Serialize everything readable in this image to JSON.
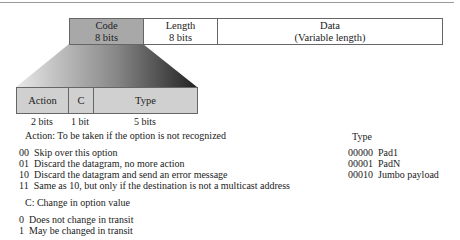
{
  "top_fields": [
    {
      "name": "Code",
      "size": "8 bits"
    },
    {
      "name": "Length",
      "size": "8 bits"
    },
    {
      "name": "Data",
      "size": "(Variable length)"
    }
  ],
  "code_fields": [
    {
      "name": "Action",
      "size": "2 bits"
    },
    {
      "name": "C",
      "size": "1 bit"
    },
    {
      "name": "Type",
      "size": "5 bits"
    }
  ],
  "action": {
    "title": "Action: To be taken if the option is not recognized",
    "items": [
      {
        "code": "00",
        "text": "Skip over this option"
      },
      {
        "code": "01",
        "text": "Discard the datagram, no more action"
      },
      {
        "code": "10",
        "text": "Discard the datagram and send an error message"
      },
      {
        "code": "11",
        "text": "Same as 10, but only if the destination is not a multicast address"
      }
    ]
  },
  "change": {
    "title": "C: Change in option value",
    "items": [
      {
        "code": "0",
        "text": "Does not change in transit"
      },
      {
        "code": "1",
        "text": "May be changed in transit"
      }
    ]
  },
  "type": {
    "title": "Type",
    "items": [
      {
        "code": "00000",
        "text": "Pad1"
      },
      {
        "code": "00001",
        "text": "PadN"
      },
      {
        "code": "00010",
        "text": "Jumbo payload"
      }
    ]
  }
}
